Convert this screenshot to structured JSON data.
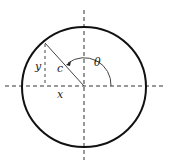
{
  "diagram": {
    "labels": {
      "y": "y",
      "c": "c",
      "theta": "θ",
      "x": "x"
    },
    "colors": {
      "stroke": "#111111",
      "dash": "#333333"
    }
  }
}
